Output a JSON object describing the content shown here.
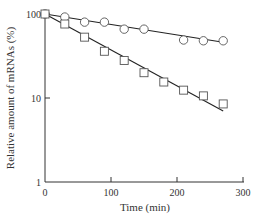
{
  "chart_data": {
    "type": "scatter",
    "title": "",
    "xlabel": "Time (min)",
    "ylabel": "Relative amount of mRNAs (%)",
    "xlim": [
      0,
      300
    ],
    "ylim": [
      1,
      100
    ],
    "yscale": "log",
    "grid": false,
    "legend": null,
    "x_ticks": [
      "0",
      "100",
      "200",
      "300"
    ],
    "y_ticks": [
      "1",
      "10",
      "100"
    ],
    "series": [
      {
        "name": "circles",
        "marker": "circle",
        "x": [
          0,
          30,
          60,
          90,
          120,
          150,
          210,
          240,
          270
        ],
        "values": [
          100,
          92,
          80,
          80,
          66,
          66,
          49,
          48,
          48
        ],
        "fit_line": {
          "x": [
            0,
            270
          ],
          "y": [
            100,
            46
          ]
        }
      },
      {
        "name": "squares",
        "marker": "square",
        "x": [
          0,
          30,
          60,
          90,
          120,
          150,
          180,
          210,
          240,
          270
        ],
        "values": [
          100,
          76,
          53,
          36,
          28,
          20,
          15.5,
          12.4,
          10.6,
          8.5
        ],
        "fit_line": {
          "x": [
            0,
            270
          ],
          "y": [
            100,
            7
          ]
        }
      }
    ]
  }
}
